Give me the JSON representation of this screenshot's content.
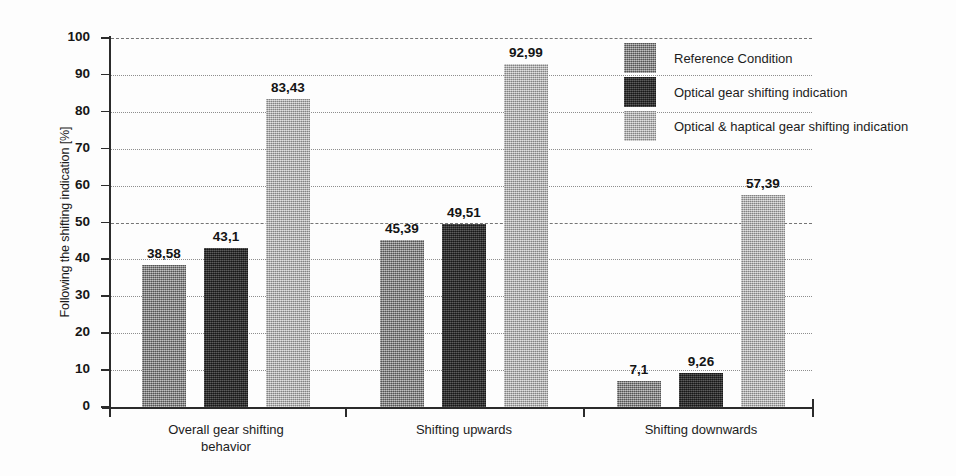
{
  "chart_data": {
    "type": "bar",
    "title": "",
    "subtitle": "",
    "xlabel": "",
    "ylabel": "Following the shifting indication [%]",
    "ylim": [
      0,
      100
    ],
    "ytick_step": 10,
    "yticks": [
      "100",
      "90",
      "80",
      "70",
      "60",
      "50",
      "40",
      "30",
      "20",
      "10",
      "0"
    ],
    "grid": true,
    "grid_style": "dotted-horizontal",
    "legend_position": "top-right",
    "value_label_format": "comma-decimal",
    "categories": [
      "Overall gear shifting\nbehavior",
      "Shifting upwards",
      "Shifting downwards"
    ],
    "series": [
      {
        "name": "Reference Condition",
        "color": "#878787",
        "values": [
          38.58,
          45.39,
          7.1
        ],
        "labels": [
          "38,58",
          "45,39",
          "7,1"
        ]
      },
      {
        "name": "Optical gear shifting indication",
        "color": "#2f2f2f",
        "values": [
          43.1,
          49.51,
          9.26
        ],
        "labels": [
          "43,1",
          "49,51",
          "9,26"
        ]
      },
      {
        "name": "Optical & haptical gear shifting indication",
        "color": "#adadad",
        "values": [
          83.43,
          92.99,
          57.39
        ],
        "labels": [
          "83,43",
          "92,99",
          "57,39"
        ]
      }
    ]
  },
  "legend": {
    "items": [
      {
        "label": "Reference Condition",
        "swatch": "#878787"
      },
      {
        "label": "Optical gear shifting indication",
        "swatch": "#2f2f2f"
      },
      {
        "label": "Optical & haptical gear shifting indication",
        "swatch": "#adadad"
      }
    ]
  },
  "axes": {
    "y_title": "Following the shifting indication [%]",
    "y_ticks": [
      "100",
      "90",
      "80",
      "70",
      "60",
      "50",
      "40",
      "30",
      "20",
      "10",
      "0"
    ],
    "x_categories": [
      "Overall gear shifting\nbehavior",
      "Shifting upwards",
      "Shifting downwards"
    ]
  }
}
